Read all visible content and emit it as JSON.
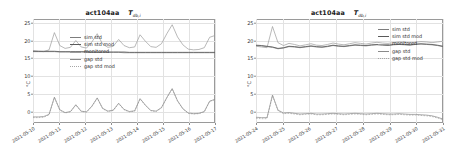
{
  "figure": {
    "width": 451,
    "height": 151,
    "background": "#ffffff"
  },
  "colors": {
    "sim_std": "#7d7d7d",
    "sim_std_mod": "#5a5a5a",
    "monitored": "#9b9b9b",
    "gap_std": "#8a8a8a",
    "gap_std_mod": "#a6a6a6",
    "axis": "#9a9a9a",
    "grid": "#e2e2e2",
    "text": "#2b2b2b"
  },
  "panels": [
    {
      "id": "left",
      "title_main": "act104aa",
      "title_symbol": "T",
      "title_subscript": "db,i",
      "ylabel": "°C",
      "yticks": [
        "0",
        "5",
        "10",
        "15",
        "20",
        "25"
      ],
      "xticks": [
        "2021-05-10",
        "2021-05-11",
        "2021-05-12",
        "2021-05-13",
        "2021-05-14",
        "2021-05-15",
        "2021-05-16",
        "2021-05-17"
      ],
      "legend": [
        {
          "label": "sim std",
          "style": "solid",
          "color": "#7d7d7d"
        },
        {
          "label": "sim std mod",
          "style": "solid",
          "color": "#5a5a5a"
        },
        {
          "label": "monitored",
          "style": "solid",
          "color": "#9b9b9b"
        },
        {
          "label": "gap std",
          "style": "solid",
          "color": "#8a8a8a"
        },
        {
          "label": "gap std mod",
          "style": "dashed",
          "color": "#a6a6a6"
        }
      ]
    },
    {
      "id": "right",
      "title_main": "act104aa",
      "title_symbol": "T",
      "title_subscript": "db,i",
      "ylabel": "°C",
      "yticks": [
        "0",
        "5",
        "10",
        "15",
        "20",
        "25"
      ],
      "xticks": [
        "2021-05-24",
        "2021-05-25",
        "2021-05-26",
        "2021-05-27",
        "2021-05-28",
        "2021-05-29",
        "2021-05-30",
        "2021-05-31"
      ],
      "legend": [
        {
          "label": "sim std",
          "style": "solid",
          "color": "#7d7d7d"
        },
        {
          "label": "sim std mod",
          "style": "solid",
          "color": "#5a5a5a"
        },
        {
          "label": "monitored",
          "style": "solid",
          "color": "#9b9b9b"
        },
        {
          "label": "gap std",
          "style": "solid",
          "color": "#8a8a8a"
        },
        {
          "label": "gap std mod",
          "style": "dashed",
          "color": "#a6a6a6"
        }
      ]
    }
  ],
  "chart_data": [
    {
      "type": "line",
      "panel": "left",
      "title": "act104aa  T_db,i",
      "xlabel": "",
      "ylabel": "°C",
      "ylim": [
        -2,
        27
      ],
      "yticks": [
        0,
        5,
        10,
        15,
        20,
        25
      ],
      "grid": true,
      "legend_position": "center-left",
      "x": [
        "2021-05-10",
        "2021-05-11",
        "2021-05-12",
        "2021-05-13",
        "2021-05-14",
        "2021-05-15",
        "2021-05-16",
        "2021-05-17"
      ],
      "series": [
        {
          "name": "monitored",
          "values": [
            18.2,
            18.0,
            17.9,
            18.4,
            23.2,
            19.6,
            18.8,
            19.1,
            21.0,
            19.2,
            18.9,
            20.6,
            22.9,
            20.0,
            19.1,
            19.4,
            21.3,
            19.6,
            19.0,
            19.2,
            22.6,
            20.8,
            19.3,
            19.1,
            20.1,
            22.9,
            25.4,
            22.0,
            19.8,
            18.6,
            18.4,
            18.5,
            19.0,
            21.9,
            22.4
          ]
        },
        {
          "name": "sim std",
          "values": [
            17.9,
            17.9,
            17.9,
            17.9,
            17.9,
            17.8,
            17.8,
            17.8,
            17.8,
            17.8,
            17.7,
            17.7,
            17.7,
            17.7,
            17.7,
            17.7,
            17.7,
            17.6,
            17.6,
            17.6,
            17.6,
            17.6,
            17.6,
            17.6,
            17.6,
            17.6,
            17.6,
            17.6,
            17.6,
            17.6,
            17.6,
            17.6,
            17.6,
            17.6,
            17.6
          ]
        },
        {
          "name": "sim std mod",
          "values": [
            18.0,
            18.0,
            18.0,
            18.0,
            18.0,
            17.9,
            17.9,
            17.9,
            17.9,
            17.9,
            17.9,
            17.8,
            17.8,
            17.8,
            17.8,
            17.8,
            17.8,
            17.8,
            17.7,
            17.7,
            17.7,
            17.7,
            17.7,
            17.7,
            17.7,
            17.7,
            17.7,
            17.7,
            17.7,
            17.7,
            17.7,
            17.7,
            17.7,
            17.7,
            17.7
          ]
        },
        {
          "name": "gap std",
          "values": [
            -0.3,
            -0.3,
            -0.2,
            0.4,
            5.2,
            1.7,
            0.9,
            1.2,
            3.1,
            1.3,
            1.1,
            2.7,
            5.0,
            2.1,
            1.3,
            1.6,
            3.5,
            1.8,
            1.2,
            1.4,
            4.8,
            3.0,
            1.5,
            1.3,
            2.3,
            5.1,
            7.6,
            4.2,
            2.0,
            0.8,
            0.6,
            0.7,
            1.2,
            4.1,
            4.6
          ]
        },
        {
          "name": "gap std mod",
          "values": [
            -0.5,
            -0.5,
            -0.4,
            0.3,
            5.1,
            1.6,
            0.8,
            1.1,
            3.0,
            1.2,
            1.0,
            2.6,
            4.9,
            2.0,
            1.2,
            1.5,
            3.4,
            1.7,
            1.1,
            1.3,
            4.7,
            2.9,
            1.4,
            1.2,
            2.2,
            5.0,
            7.5,
            4.1,
            1.9,
            0.7,
            0.5,
            0.6,
            1.1,
            4.0,
            4.5
          ]
        }
      ]
    },
    {
      "type": "line",
      "panel": "right",
      "title": "act104aa  T_db,i",
      "xlabel": "",
      "ylabel": "°C",
      "ylim": [
        -2,
        27
      ],
      "yticks": [
        0,
        5,
        10,
        15,
        20,
        25
      ],
      "grid": true,
      "legend_position": "center-right",
      "x": [
        "2021-05-24",
        "2021-05-25",
        "2021-05-26",
        "2021-05-27",
        "2021-05-28",
        "2021-05-29",
        "2021-05-30",
        "2021-05-31"
      ],
      "series": [
        {
          "name": "monitored",
          "values": [
            19.4,
            19.2,
            19.0,
            24.9,
            20.4,
            19.6,
            20.2,
            19.9,
            19.5,
            19.8,
            20.1,
            19.7,
            19.6,
            19.9,
            20.3,
            20.0,
            19.8,
            20.1,
            20.4,
            20.2,
            20.0,
            20.3,
            20.5,
            20.3,
            20.2,
            20.4,
            20.6,
            20.5,
            20.3,
            20.5,
            20.7,
            20.6,
            20.4,
            20.6,
            20.8
          ]
        },
        {
          "name": "sim std",
          "values": [
            19.6,
            19.5,
            19.3,
            19.1,
            18.7,
            18.9,
            19.3,
            19.2,
            19.0,
            19.2,
            19.4,
            19.2,
            19.1,
            19.3,
            19.6,
            19.4,
            19.3,
            19.5,
            19.7,
            19.6,
            19.5,
            19.7,
            19.8,
            19.7,
            19.6,
            19.8,
            19.9,
            19.8,
            19.7,
            19.9,
            20.0,
            19.9,
            19.8,
            19.6,
            19.3
          ]
        },
        {
          "name": "sim std mod",
          "values": [
            19.7,
            19.6,
            19.4,
            19.2,
            18.8,
            19.0,
            19.4,
            19.3,
            19.1,
            19.3,
            19.5,
            19.3,
            19.2,
            19.4,
            19.7,
            19.5,
            19.4,
            19.6,
            19.8,
            19.7,
            19.6,
            19.8,
            19.9,
            19.8,
            19.7,
            19.9,
            20.0,
            19.9,
            19.8,
            20.0,
            20.1,
            20.0,
            19.9,
            19.7,
            19.4
          ]
        },
        {
          "name": "gap std",
          "values": [
            -0.4,
            -0.5,
            -0.5,
            5.8,
            1.6,
            0.8,
            0.9,
            0.7,
            0.5,
            0.6,
            0.7,
            0.5,
            0.5,
            0.6,
            0.7,
            0.6,
            0.5,
            0.6,
            0.7,
            0.6,
            0.5,
            0.6,
            0.7,
            0.6,
            0.5,
            0.5,
            0.6,
            0.5,
            0.4,
            0.4,
            0.3,
            0.2,
            0.0,
            -0.4,
            -0.9
          ]
        },
        {
          "name": "gap std mod",
          "values": [
            -0.7,
            -0.8,
            -0.8,
            5.6,
            1.4,
            0.6,
            0.7,
            0.5,
            0.3,
            0.4,
            0.5,
            0.3,
            0.3,
            0.4,
            0.5,
            0.4,
            0.3,
            0.4,
            0.5,
            0.4,
            0.3,
            0.4,
            0.5,
            0.4,
            0.3,
            0.3,
            0.4,
            0.3,
            0.2,
            0.2,
            0.1,
            0.0,
            -0.2,
            -0.6,
            -1.1
          ]
        }
      ]
    }
  ]
}
